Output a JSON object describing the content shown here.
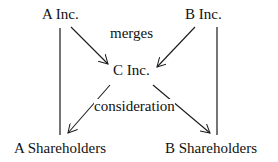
{
  "nodes": {
    "a_inc": "A Inc.",
    "b_inc": "B Inc.",
    "c_inc": "C Inc.",
    "a_shareholders": "A Shareholders",
    "b_shareholders": "B Shareholders"
  },
  "edge_labels": {
    "merges": "merges",
    "consideration": "consideration"
  },
  "colors": {
    "line": "#1a1a1a",
    "text": "#111111",
    "background": "#ffffff"
  }
}
